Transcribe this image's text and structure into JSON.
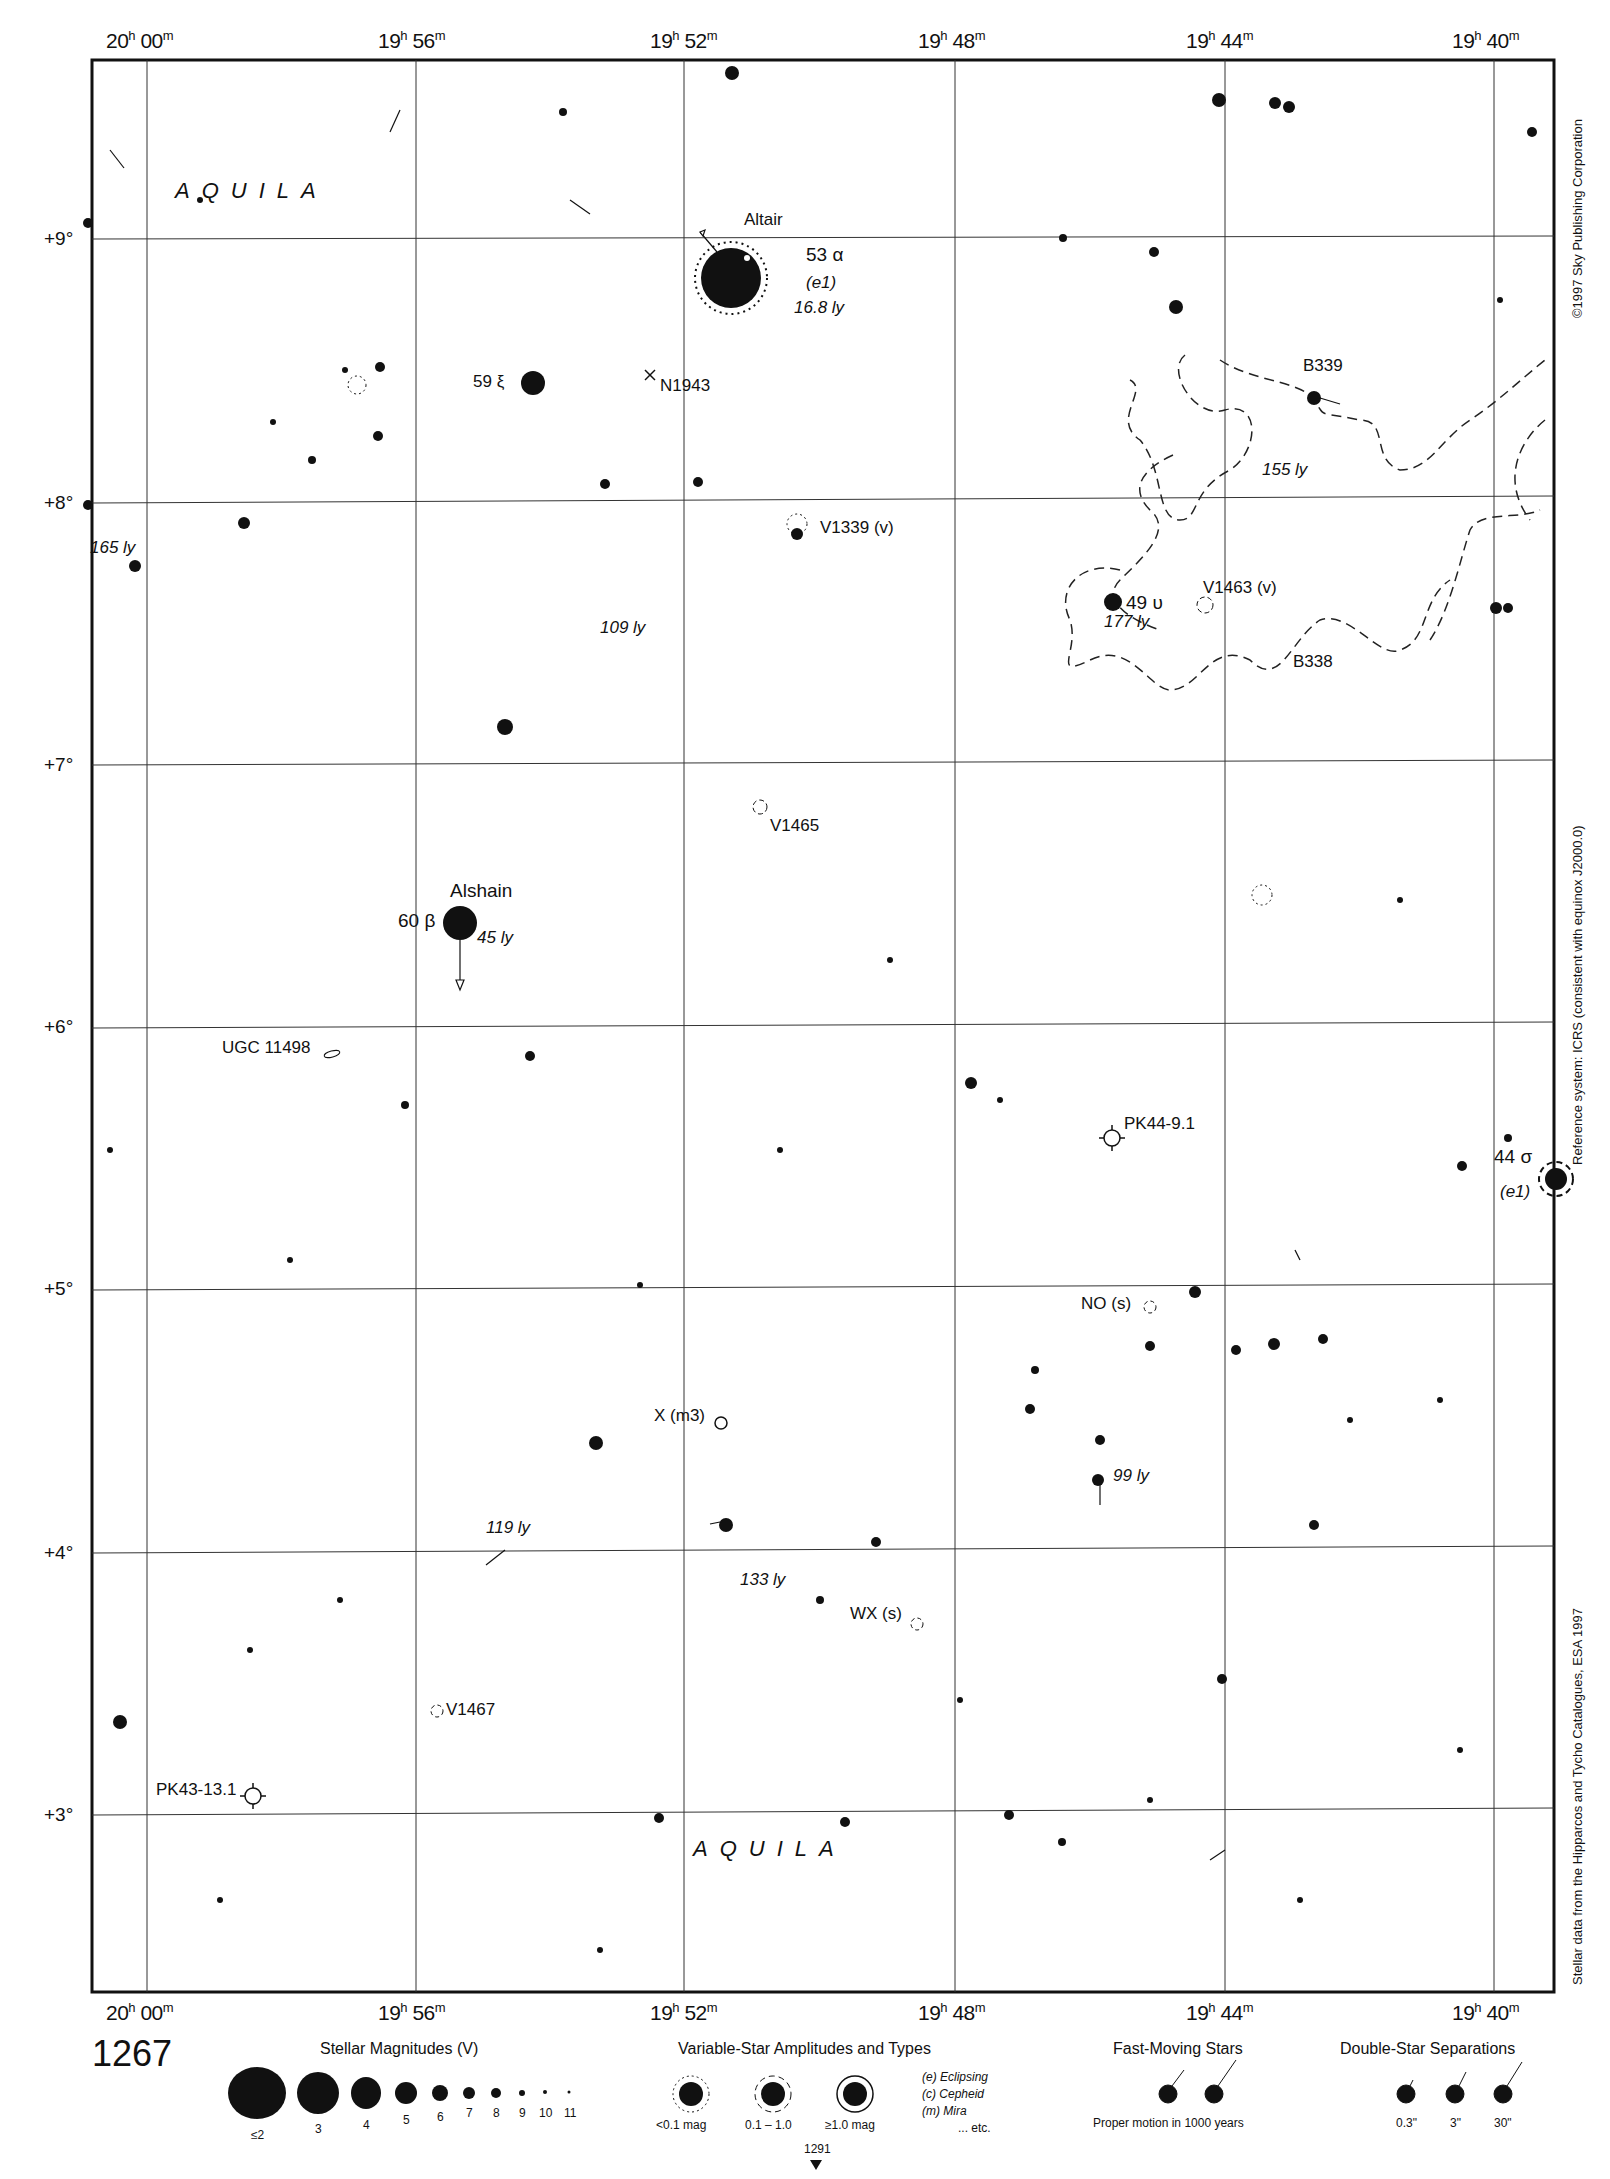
{
  "chart_number": "1267",
  "continuation_page": "1291",
  "constellation": "AQUILA",
  "ra_labels": [
    {
      "h": "20",
      "m": "00",
      "x": 106
    },
    {
      "h": "19",
      "m": "56",
      "x": 378
    },
    {
      "h": "19",
      "m": "52",
      "x": 650
    },
    {
      "h": "19",
      "m": "48",
      "x": 918
    },
    {
      "h": "19",
      "m": "44",
      "x": 1186
    },
    {
      "h": "19",
      "m": "40",
      "x": 1452
    }
  ],
  "dec_labels": [
    {
      "label": "+9°",
      "y": 242
    },
    {
      "label": "+8°",
      "y": 505
    },
    {
      "label": "+7°",
      "y": 767
    },
    {
      "label": "+6°",
      "y": 1030
    },
    {
      "label": "+5°",
      "y": 1292
    },
    {
      "label": "+4°",
      "y": 1555
    },
    {
      "label": "+3°",
      "y": 1817
    }
  ],
  "side_notes": {
    "copyright": "©1997 Sky Publishing Corporation",
    "reference": "Reference system: ICRS (consistent with equinox J2000.0)",
    "data_source": "Stellar data from the Hipparcos and Tycho Catalogues, ESA 1997"
  },
  "labels": {
    "altair_name": "Altair",
    "altair_id": "53 α",
    "altair_var": "(e1)",
    "altair_dist": "16.8 ly",
    "xi_id": "59 ξ",
    "n1943": "N1943",
    "b339": "B339",
    "dist_155": "155 ly",
    "v1339": "V1339 (v)",
    "dist_165": "165 ly",
    "dist_109": "109 ly",
    "upsilon_id": "49 υ",
    "dist_177": "177 ly",
    "v1463": "V1463 (v)",
    "b338": "B338",
    "v1465": "V1465",
    "alshain_name": "Alshain",
    "beta_id": "60 β",
    "dist_45": "45 ly",
    "ugc": "UGC 11498",
    "pk44": "PK44-9.1",
    "sigma_id": "44 σ",
    "sigma_var": "(e1)",
    "no_s": "NO (s)",
    "x_m3": "X (m3)",
    "dist_99": "99 ly",
    "dist_119": "119 ly",
    "dist_133": "133 ly",
    "wx_s": "WX (s)",
    "v1467": "V1467",
    "pk43": "PK43-13.1"
  },
  "legend": {
    "magnitudes_title": "Stellar Magnitudes (V)",
    "magnitudes": [
      "≤2",
      "3",
      "4",
      "5",
      "6",
      "7",
      "8",
      "9",
      "10",
      "11"
    ],
    "variable_title": "Variable-Star Amplitudes and Types",
    "variable_amps": [
      "<0.1 mag",
      "0.1 – 1.0",
      "≥1.0 mag"
    ],
    "variable_types": [
      "(e)  Eclipsing",
      "(c)  Cepheid",
      "(m)  Mira",
      "... etc."
    ],
    "fast_title": "Fast-Moving Stars",
    "fast_note": "Proper motion in 1000 years",
    "double_title": "Double-Star Separations",
    "double_seps": [
      "0.3\"",
      "3\"",
      "30\""
    ]
  }
}
